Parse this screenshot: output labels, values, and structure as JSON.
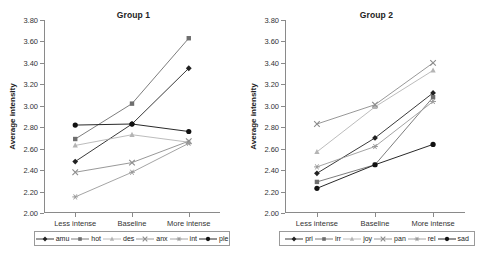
{
  "figure": {
    "background": "#ffffff"
  },
  "chart_data": [
    {
      "type": "line",
      "title": "Group 1",
      "xlabel": "",
      "ylabel": "Average intensity",
      "categories": [
        "Less intense",
        "Baseline",
        "More intense"
      ],
      "ylim": [
        2.0,
        3.8
      ],
      "ytick_step": 0.2,
      "yticks": [
        "3.80",
        "3.60",
        "3.40",
        "3.20",
        "3.00",
        "2.80",
        "2.60",
        "2.40",
        "2.20",
        "2.00"
      ],
      "grid": false,
      "legend_position": "bottom",
      "series": [
        {
          "name": "amu",
          "values": [
            2.48,
            2.83,
            3.35
          ],
          "marker": "diamond",
          "color": "#222222"
        },
        {
          "name": "hot",
          "values": [
            2.69,
            3.02,
            3.63
          ],
          "marker": "square",
          "color": "#6e6e6e"
        },
        {
          "name": "des",
          "values": [
            2.63,
            2.73,
            2.66
          ],
          "marker": "triangle",
          "color": "#b4b4b4"
        },
        {
          "name": "anx",
          "values": [
            2.38,
            2.47,
            2.67
          ],
          "marker": "cross",
          "color": "#8c8c8c"
        },
        {
          "name": "int",
          "values": [
            2.15,
            2.38,
            2.65
          ],
          "marker": "asterisk",
          "color": "#9a9a9a"
        },
        {
          "name": "ple",
          "values": [
            2.82,
            2.83,
            2.76
          ],
          "marker": "circle",
          "color": "#111111"
        }
      ]
    },
    {
      "type": "line",
      "title": "Group 2",
      "xlabel": "",
      "ylabel": "Average intensity",
      "categories": [
        "Less intense",
        "Baseline",
        "More intense"
      ],
      "ylim": [
        2.0,
        3.8
      ],
      "ytick_step": 0.2,
      "yticks": [
        "3.80",
        "3.60",
        "3.40",
        "3.20",
        "3.00",
        "2.80",
        "2.60",
        "2.40",
        "2.20",
        "2.00"
      ],
      "grid": false,
      "legend_position": "bottom",
      "series": [
        {
          "name": "pri",
          "values": [
            2.37,
            2.7,
            3.12
          ],
          "marker": "diamond",
          "color": "#222222"
        },
        {
          "name": "irr",
          "values": [
            2.29,
            2.45,
            3.08
          ],
          "marker": "square",
          "color": "#6e6e6e"
        },
        {
          "name": "joy",
          "values": [
            2.57,
            2.99,
            3.33
          ],
          "marker": "triangle",
          "color": "#b4b4b4"
        },
        {
          "name": "pan",
          "values": [
            2.83,
            3.01,
            3.4
          ],
          "marker": "cross",
          "color": "#8c8c8c"
        },
        {
          "name": "rel",
          "values": [
            2.43,
            2.62,
            3.04
          ],
          "marker": "asterisk",
          "color": "#9a9a9a"
        },
        {
          "name": "sad",
          "values": [
            2.23,
            2.45,
            2.64
          ],
          "marker": "circle",
          "color": "#111111"
        }
      ]
    }
  ]
}
